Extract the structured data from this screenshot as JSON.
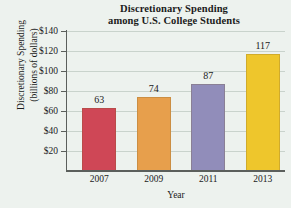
{
  "chart_data": {
    "type": "bar",
    "title": "Discretionary Spending among U.S. College Students",
    "title_lines": [
      "Discretionary Spending",
      "among U.S. College Students"
    ],
    "xlabel": "Year",
    "ylabel": "Discretionary Spending (billions of dollars)",
    "ylabel_lines": [
      "Discretionary Spending",
      "(billions of dollars)"
    ],
    "categories": [
      "2007",
      "2009",
      "2011",
      "2013"
    ],
    "values": [
      63,
      74,
      87,
      117
    ],
    "value_labels": [
      "63",
      "74",
      "87",
      "117"
    ],
    "bar_colors": [
      "#cf4756",
      "#e79f4c",
      "#918dba",
      "#eec62c"
    ],
    "ylim": [
      0,
      140
    ],
    "yticks": [
      20,
      40,
      60,
      80,
      100,
      120,
      140
    ],
    "ytick_labels": [
      "$20",
      "$40",
      "$60",
      "$80",
      "$100",
      "$120",
      "$140"
    ],
    "grid": "horizontal",
    "legend": "none",
    "background_color": "#edf2ee",
    "gridline_color": "#c9d3cc",
    "axis_color": "#5b5f5c"
  }
}
